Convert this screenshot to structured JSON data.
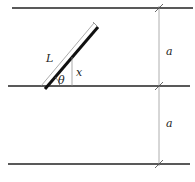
{
  "diagram": {
    "labels": {
      "needle_length": "L",
      "angle": "θ",
      "height": "x",
      "spacing_top": "a",
      "spacing_bottom": "a"
    },
    "colors": {
      "line": "#222222",
      "needle": "#111111",
      "dimension": "#999999"
    }
  }
}
